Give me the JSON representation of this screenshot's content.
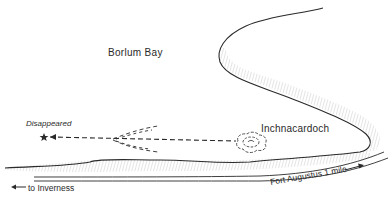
{
  "map": {
    "title": "Sighting sketch map near Borlum Bay",
    "labels": {
      "bay": "Borlum Bay",
      "point": "Inchnacardoch",
      "disappeared": "Disappeared",
      "to_inverness": "to Inverness",
      "fort_augustus": "Fort Augustus 1 mile"
    },
    "symbols": {
      "disappear_marker": "star-icon",
      "wake": "dashed-track-arrow",
      "disturbance": "ripple-circle"
    },
    "arrows": {
      "inverness": "←",
      "fort_augustus": "→"
    },
    "colors": {
      "ink": "#2a2a2a",
      "hatch": "#8a8a8a",
      "background": "#ffffff"
    }
  }
}
